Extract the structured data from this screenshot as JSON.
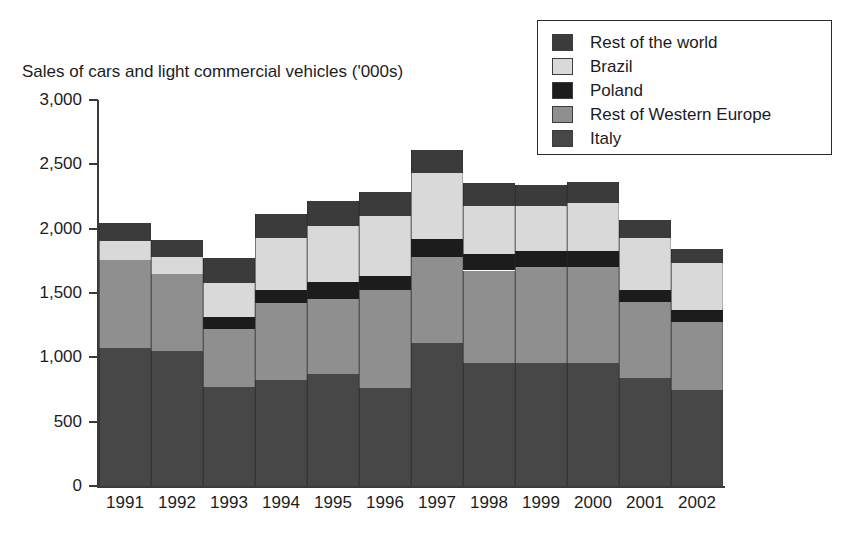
{
  "chart_data": {
    "type": "bar",
    "stacked": true,
    "title": "Sales of cars and light commercial vehicles ('000s)",
    "xlabel": "",
    "ylabel": "",
    "ylim": [
      0,
      3000
    ],
    "ytick_step": 500,
    "ytick_labels": [
      "3,000",
      "2,500",
      "2,000",
      "1,500",
      "1,000",
      "500",
      "0"
    ],
    "ytick_values": [
      3000,
      2500,
      2000,
      1500,
      1000,
      500,
      0
    ],
    "grid": false,
    "legend_position": "top-right",
    "categories": [
      "1991",
      "1992",
      "1993",
      "1994",
      "1995",
      "1996",
      "1997",
      "1998",
      "1999",
      "2000",
      "2001",
      "2002"
    ],
    "series": [
      {
        "name": "Italy",
        "color": "#474747",
        "values": [
          1070,
          1050,
          770,
          825,
          870,
          760,
          1110,
          955,
          955,
          955,
          840,
          745
        ]
      },
      {
        "name": "Rest of Western Europe",
        "color": "#8f8f8f",
        "values": [
          690,
          600,
          450,
          600,
          585,
          760,
          670,
          720,
          745,
          745,
          590,
          530
        ]
      },
      {
        "name": "Poland",
        "color": "#1c1c1c",
        "values": [
          0,
          0,
          95,
          100,
          130,
          115,
          140,
          130,
          125,
          125,
          95,
          95
        ]
      },
      {
        "name": "Brazil",
        "color": "#d9d9d9",
        "values": [
          145,
          130,
          265,
          405,
          435,
          465,
          515,
          375,
          350,
          375,
          405,
          365
        ]
      },
      {
        "name": "Rest of the world",
        "color": "#3b3b3b",
        "values": [
          140,
          130,
          195,
          185,
          195,
          185,
          180,
          175,
          165,
          160,
          135,
          105
        ]
      }
    ],
    "legend_order": [
      "Rest of the world",
      "Brazil",
      "Poland",
      "Rest of Western Europe",
      "Italy"
    ],
    "totals": [
      2045,
      1910,
      1775,
      2115,
      2215,
      2285,
      2615,
      2355,
      2340,
      2360,
      2065,
      1840
    ]
  }
}
